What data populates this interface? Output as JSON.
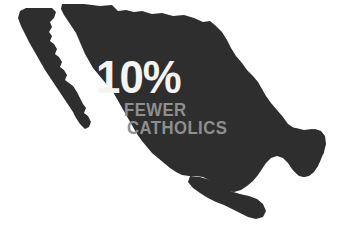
{
  "infographic": {
    "headline": "10%",
    "subline_1": "FEWER",
    "subline_2": "CATHOLICS",
    "subject": "Mexico",
    "colors": {
      "background": "#ffffff",
      "map_fill": "#2e2e2e",
      "headline_text": "#f4f4f2",
      "subline_text": "#8e8e8e"
    }
  }
}
